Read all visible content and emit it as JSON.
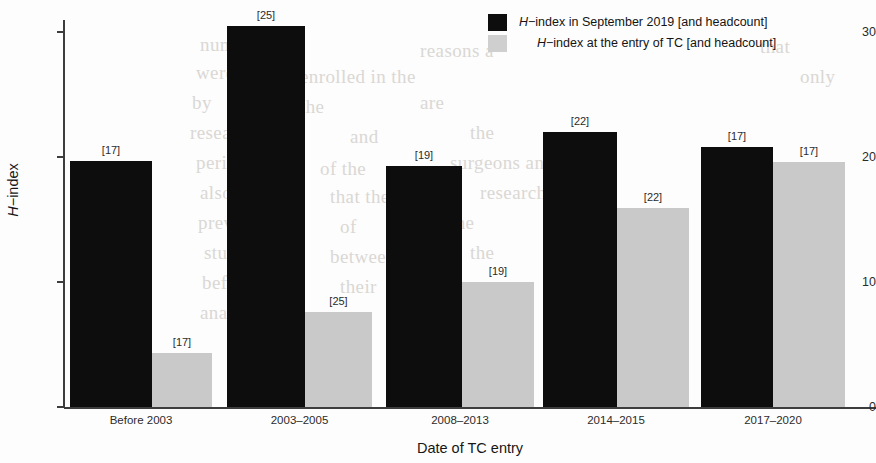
{
  "chart_data": {
    "type": "bar",
    "title": "",
    "xlabel": "Date of TC entry",
    "ylabel": "H−index",
    "ylim": [
      0,
      32
    ],
    "yticks": [
      0,
      10,
      20,
      30
    ],
    "ytick_labels": [
      "0",
      "10",
      "20",
      "30"
    ],
    "grid": false,
    "legend_position": "top-right",
    "categories": [
      "Before 2003",
      "2003–2005",
      "2008–2013",
      "2014–2015",
      "2017–2020"
    ],
    "series": [
      {
        "name": "H−index in September 2019 [and headcount]",
        "color": "#0d0d0d",
        "values": [
          19.7,
          30.5,
          19.3,
          22.0,
          20.8
        ],
        "labels": [
          "[17]",
          "[25]",
          "[19]",
          "[22]",
          "[17]"
        ]
      },
      {
        "name": "H−index at the entry of TC [and headcount]",
        "color": "#c9c9c9",
        "values": [
          4.3,
          7.6,
          10.0,
          15.9,
          19.6
        ],
        "labels": [
          "[17]",
          "[25]",
          "[19]",
          "[22]",
          "[17]"
        ]
      }
    ]
  },
  "axis": {
    "y_title_prefix": "H",
    "y_title_suffix": "−index",
    "x_title": "Date of TC entry"
  },
  "legend": {
    "items": [
      {
        "swatch": "dark",
        "prefix": "H",
        "text": "−index in September 2019 [and headcount]"
      },
      {
        "swatch": "light",
        "prefix": "H",
        "text": "−index at the entry of TC [and headcount]"
      }
    ]
  },
  "background_bleed": [
    {
      "x": 200,
      "y": 34,
      "text": "number"
    },
    {
      "x": 420,
      "y": 40,
      "text": "reasons a"
    },
    {
      "x": 760,
      "y": 36,
      "text": "that"
    },
    {
      "x": 196,
      "y": 62,
      "text": "were"
    },
    {
      "x": 300,
      "y": 66,
      "text": "enrolled in the"
    },
    {
      "x": 800,
      "y": 66,
      "text": "only"
    },
    {
      "x": 192,
      "y": 92,
      "text": "by"
    },
    {
      "x": 300,
      "y": 96,
      "text": "the"
    },
    {
      "x": 420,
      "y": 92,
      "text": "are"
    },
    {
      "x": 190,
      "y": 122,
      "text": "research"
    },
    {
      "x": 350,
      "y": 126,
      "text": "and"
    },
    {
      "x": 470,
      "y": 122,
      "text": "the"
    },
    {
      "x": 196,
      "y": 152,
      "text": "period"
    },
    {
      "x": 320,
      "y": 158,
      "text": "of the"
    },
    {
      "x": 450,
      "y": 152,
      "text": "surgeons and"
    },
    {
      "x": 200,
      "y": 182,
      "text": "also"
    },
    {
      "x": 330,
      "y": 186,
      "text": "that the"
    },
    {
      "x": 480,
      "y": 182,
      "text": "research"
    },
    {
      "x": 198,
      "y": 212,
      "text": "previous"
    },
    {
      "x": 340,
      "y": 216,
      "text": "of"
    },
    {
      "x": 450,
      "y": 212,
      "text": "the"
    },
    {
      "x": 204,
      "y": 242,
      "text": "study"
    },
    {
      "x": 330,
      "y": 246,
      "text": "between"
    },
    {
      "x": 470,
      "y": 242,
      "text": "the"
    },
    {
      "x": 202,
      "y": 272,
      "text": "before"
    },
    {
      "x": 340,
      "y": 276,
      "text": "their"
    },
    {
      "x": 200,
      "y": 302,
      "text": "analysis"
    },
    {
      "x": 330,
      "y": 306,
      "text": "a"
    }
  ]
}
